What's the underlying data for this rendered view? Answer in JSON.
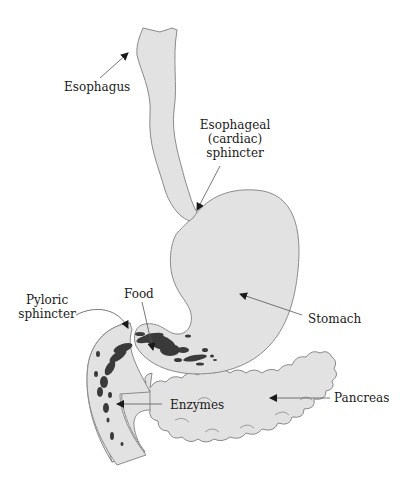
{
  "diagram": {
    "colors": {
      "organ_fill": "#e2e2e2",
      "organ_stroke": "#8a8a8a",
      "food": "#3a3a3a",
      "arrow": "#555555",
      "text": "#1a1a1a"
    },
    "labels": {
      "esophagus": "Esophagus",
      "esophageal_sphincter_line1": "Esophageal",
      "esophageal_sphincter_line2": "(cardiac)",
      "esophageal_sphincter_line3": "sphincter",
      "stomach": "Stomach",
      "food": "Food",
      "pyloric_sphincter_line1": "Pyloric",
      "pyloric_sphincter_line2": "sphincter",
      "enzymes": "Enzymes",
      "pancreas": "Pancreas"
    }
  }
}
